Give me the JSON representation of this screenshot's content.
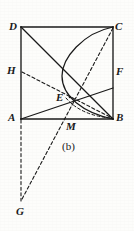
{
  "figure": {
    "caption": "(b)",
    "canvas": {
      "width": 134,
      "height": 231
    },
    "stroke_color": "#1a1a1a",
    "background_color": "#fdfdfb",
    "labels": [
      {
        "id": "D",
        "text": "D",
        "x": 9,
        "y": 21
      },
      {
        "id": "C",
        "text": "C",
        "x": 115,
        "y": 21
      },
      {
        "id": "H",
        "text": "H",
        "x": 7,
        "y": 65
      },
      {
        "id": "F",
        "text": "F",
        "x": 116,
        "y": 66
      },
      {
        "id": "E",
        "text": "E",
        "x": 56,
        "y": 92
      },
      {
        "id": "A",
        "text": "A",
        "x": 8,
        "y": 112
      },
      {
        "id": "B",
        "text": "B",
        "x": 116,
        "y": 112
      },
      {
        "id": "M",
        "text": "M",
        "x": 66,
        "y": 121
      },
      {
        "id": "G",
        "text": "G",
        "x": 16,
        "y": 206
      }
    ],
    "points": {
      "A": {
        "x": 21,
        "y": 119
      },
      "B": {
        "x": 113,
        "y": 119
      },
      "C": {
        "x": 113,
        "y": 27
      },
      "D": {
        "x": 21,
        "y": 27
      },
      "H": {
        "x": 21,
        "y": 72
      },
      "F": {
        "x": 113,
        "y": 88
      },
      "E": {
        "x": 70,
        "y": 97
      },
      "M": {
        "x": 67,
        "y": 119
      },
      "G": {
        "x": 21,
        "y": 201
      }
    },
    "shapes": {
      "square_sides": [
        {
          "name": "side-DC",
          "from": "D",
          "to": "C"
        },
        {
          "name": "side-CB",
          "from": "C",
          "to": "B"
        },
        {
          "name": "side-BA",
          "from": "B",
          "to": "A"
        },
        {
          "name": "side-AD",
          "from": "A",
          "to": "D"
        }
      ],
      "solid_segments": [
        {
          "name": "segment-DB",
          "from": "D",
          "to": "B"
        },
        {
          "name": "segment-AF",
          "from": "A",
          "to": "F"
        }
      ],
      "dashed_segments": [
        {
          "name": "segment-HB",
          "from": "H",
          "to": "B"
        },
        {
          "name": "segment-CG",
          "from": "C",
          "to": "G"
        },
        {
          "name": "segment-AG",
          "from": "A",
          "to": "G"
        }
      ],
      "arc": {
        "name": "arc-C-E-B",
        "from": "C",
        "to": "B",
        "radius": 46,
        "sweep": "counterclockwise",
        "style": "solid"
      },
      "arc_dashed": {
        "name": "arc-E-B-dashed",
        "from": "E",
        "to": "B",
        "style": "dashed"
      }
    }
  }
}
